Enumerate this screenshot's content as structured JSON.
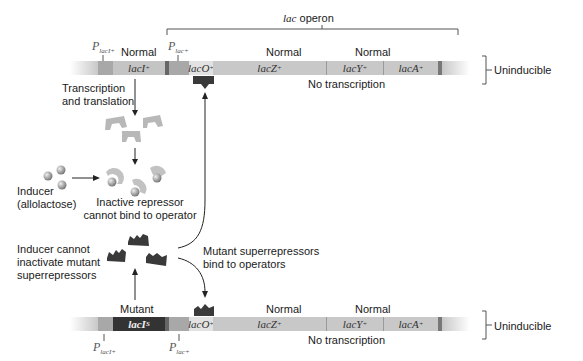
{
  "operon_bracket": {
    "label_italic": "lac",
    "label_rest": " operon"
  },
  "top_row": {
    "promoter_laci": {
      "main": "P",
      "sub": "lacI+"
    },
    "promoter_lac": {
      "main": "P",
      "sub": "lac+"
    },
    "laci_status": "Normal",
    "lacz_status": "Normal",
    "lacy_status": "Normal",
    "genes": {
      "laci": {
        "name": "lacI",
        "sup": "+"
      },
      "laco": {
        "name": "lacO",
        "sup": "+"
      },
      "lacz": {
        "name": "lacZ",
        "sup": "+"
      },
      "lacy": {
        "name": "lacY",
        "sup": "+"
      },
      "laca": {
        "name": "lacA",
        "sup": "+"
      }
    },
    "no_transcription": "No transcription",
    "phenotype": "Uninducible"
  },
  "middle": {
    "transcription_label_1": "Transcription",
    "transcription_label_2": "and translation",
    "inducer_label_1": "Inducer",
    "inducer_label_2": "(allolactose)",
    "inactive_label_1": "Inactive repressor",
    "inactive_label_2": "cannot bind to operator",
    "cannot_inactivate_1": "Inducer cannot",
    "cannot_inactivate_2": "inactivate mutant",
    "cannot_inactivate_3": "superrepressors",
    "superrep_bind_1": "Mutant superrepressors",
    "superrep_bind_2": "bind to operators"
  },
  "bottom_row": {
    "promoter_laci": {
      "main": "P",
      "sub": "lacI+"
    },
    "promoter_lac": {
      "main": "P",
      "sub": "lac+"
    },
    "laci_status": "Mutant",
    "lacz_status": "Normal",
    "lacy_status": "Normal",
    "genes": {
      "laci": {
        "name": "lacI",
        "sup": "S"
      },
      "laco": {
        "name": "lacO",
        "sup": "+"
      },
      "lacz": {
        "name": "lacZ",
        "sup": "+"
      },
      "lacy": {
        "name": "lacY",
        "sup": "+"
      },
      "laca": {
        "name": "lacA",
        "sup": "+"
      }
    },
    "no_transcription": "No transcription",
    "phenotype": "Uninducible"
  },
  "colors": {
    "dna": "#c8c8c8",
    "promoter": "#a8a8a8",
    "repressor_normal": "#b5b5b5",
    "superrepressor": "#3a3a3a",
    "inducer": "#9a9a9a",
    "mutant_gene": "#333333"
  }
}
